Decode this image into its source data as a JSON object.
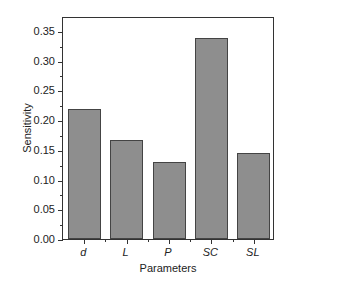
{
  "chart_data": {
    "type": "bar",
    "title": "",
    "xlabel": "Parameters",
    "ylabel": "Sensitivity",
    "categories": [
      "d",
      "L",
      "P",
      "SC",
      "SL"
    ],
    "values": [
      0.219,
      0.167,
      0.13,
      0.338,
      0.145
    ],
    "ylim": [
      0,
      0.375
    ],
    "yticks": [
      "0.00",
      "0.05",
      "0.10",
      "0.15",
      "0.20",
      "0.25",
      "0.30",
      "0.35"
    ],
    "grid": false,
    "legend": null,
    "bar_color": "#8e8e8e"
  }
}
